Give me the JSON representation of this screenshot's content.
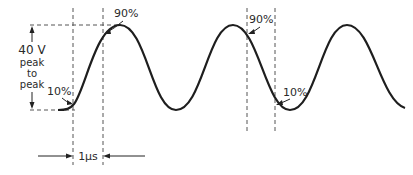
{
  "diagram": {
    "type": "waveform-rise-time",
    "amplitude_label": [
      "40 V",
      "peak",
      "to",
      "peak"
    ],
    "amplitude_value": "40 V peak to peak",
    "markers": [
      {
        "id": "left-10",
        "label": "10%"
      },
      {
        "id": "left-90",
        "label": "90%"
      },
      {
        "id": "right-90",
        "label": "90%"
      },
      {
        "id": "right-10",
        "label": "10%"
      }
    ],
    "time_label": "1μs",
    "colors": {
      "line": "#1e1e1e",
      "dash": "#555555",
      "background": "#ffffff"
    }
  }
}
